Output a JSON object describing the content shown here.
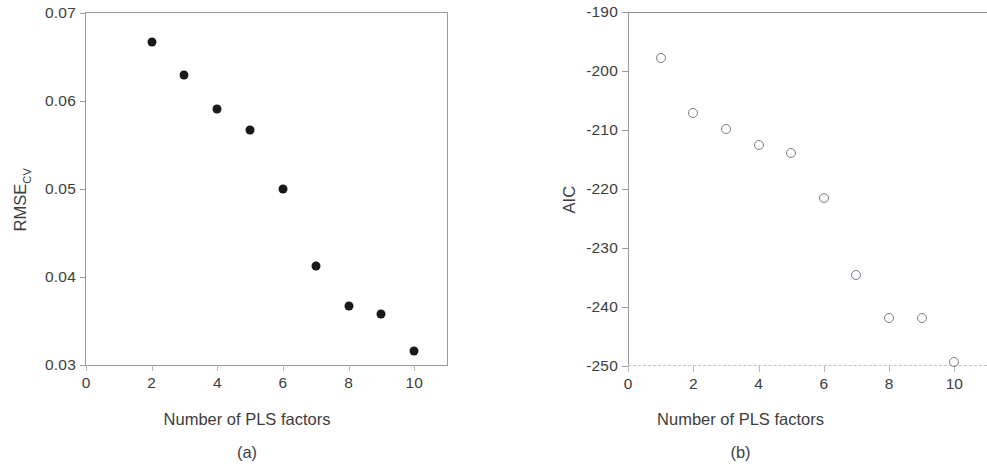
{
  "figure": {
    "panels": [
      {
        "caption": "(a)",
        "xlabel": "Number of PLS factors",
        "ylabel_main": "RMSE",
        "ylabel_sub": "CV"
      },
      {
        "caption": "(b)",
        "xlabel": "Number of PLS factors",
        "ylabel_main": "AIC",
        "ylabel_sub": ""
      }
    ]
  },
  "chart_data": [
    {
      "type": "scatter",
      "title": "",
      "panel_label": "(a)",
      "xlabel": "Number of PLS factors",
      "ylabel": "RMSE_CV",
      "xlim": [
        0,
        11
      ],
      "ylim": [
        0.03,
        0.07
      ],
      "xticks": [
        0,
        2,
        4,
        6,
        8,
        10
      ],
      "xtick_labels": [
        "0",
        "2",
        "4",
        "6",
        "8",
        "10"
      ],
      "yticks": [
        0.03,
        0.04,
        0.05,
        0.06,
        0.07
      ],
      "ytick_labels": [
        "0.03",
        "0.04",
        "0.05",
        "0.06",
        "0.07"
      ],
      "grid": false,
      "legend": "none",
      "marker": "filled-circle",
      "marker_color": "#1a1a1a",
      "x": [
        2,
        3,
        4,
        5,
        6,
        7,
        8,
        9,
        10
      ],
      "y": [
        0.0667,
        0.0629,
        0.0591,
        0.0567,
        0.05,
        0.0413,
        0.0367,
        0.0358,
        0.0316
      ]
    },
    {
      "type": "scatter",
      "title": "",
      "panel_label": "(b)",
      "xlabel": "Number of PLS factors",
      "ylabel": "AIC",
      "xlim": [
        0,
        11
      ],
      "ylim": [
        -250,
        -190
      ],
      "xticks": [
        0,
        2,
        4,
        6,
        8,
        10
      ],
      "xtick_labels": [
        "0",
        "2",
        "4",
        "6",
        "8",
        "10"
      ],
      "yticks": [
        -250,
        -240,
        -230,
        -220,
        -210,
        -200,
        -190
      ],
      "ytick_labels": [
        "-250",
        "-240",
        "-230",
        "-220",
        "-210",
        "-200",
        "-190"
      ],
      "grid": false,
      "legend": "none",
      "marker": "open-circle",
      "marker_color": "#7b7b8a",
      "x": [
        1,
        2,
        3,
        4,
        5,
        6,
        7,
        8,
        9,
        10
      ],
      "y": [
        -197.8,
        -207.2,
        -209.8,
        -212.6,
        -213.9,
        -221.6,
        -234.5,
        -241.8,
        -241.8,
        -249.3
      ]
    }
  ]
}
